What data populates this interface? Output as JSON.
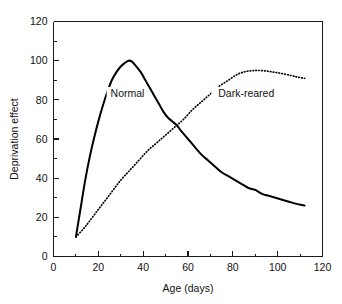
{
  "chart_data": {
    "type": "line",
    "title": "",
    "xlabel": "Age (days)",
    "ylabel": "Deprivation effect",
    "xlim": [
      0,
      120
    ],
    "ylim": [
      0,
      120
    ],
    "grid": false,
    "legend_position": "inline-annotations",
    "x_major_ticks": [
      0,
      20,
      40,
      60,
      80,
      100,
      120
    ],
    "y_major_ticks": [
      0,
      20,
      40,
      60,
      80,
      100,
      120
    ],
    "x_tick_labels": [
      "0",
      "20",
      "40",
      "60",
      "80",
      "100",
      "120"
    ],
    "y_tick_labels": [
      "0",
      "20",
      "40",
      "60",
      "80",
      "100",
      "120"
    ],
    "x_minor_ticks": [
      10,
      30,
      50,
      70,
      90,
      110
    ],
    "y_minor_ticks": [
      10,
      30,
      50,
      70,
      90,
      110
    ],
    "annotations": [
      {
        "text": "Normal",
        "x": 33,
        "y": 82
      },
      {
        "text": "Dark-reared",
        "x": 86,
        "y": 82
      }
    ],
    "series": [
      {
        "name": "Normal",
        "style": "solid",
        "color": "#000000",
        "points": [
          [
            10,
            10
          ],
          [
            12,
            24
          ],
          [
            14,
            38
          ],
          [
            16,
            50
          ],
          [
            18,
            60
          ],
          [
            20,
            69
          ],
          [
            22,
            77
          ],
          [
            24,
            84
          ],
          [
            26,
            90
          ],
          [
            28,
            94
          ],
          [
            30,
            97
          ],
          [
            32,
            99
          ],
          [
            33.5,
            100
          ],
          [
            35,
            99.5
          ],
          [
            37,
            97
          ],
          [
            39,
            94
          ],
          [
            41,
            90
          ],
          [
            43,
            86
          ],
          [
            45,
            82
          ],
          [
            47,
            78
          ],
          [
            49,
            74
          ],
          [
            51,
            71
          ],
          [
            53,
            69
          ],
          [
            55,
            67
          ],
          [
            57,
            64
          ],
          [
            60,
            60
          ],
          [
            63,
            56
          ],
          [
            66,
            52
          ],
          [
            69,
            49
          ],
          [
            72,
            46
          ],
          [
            75,
            43
          ],
          [
            78,
            41
          ],
          [
            81,
            39
          ],
          [
            84,
            37
          ],
          [
            87,
            35
          ],
          [
            90,
            34
          ],
          [
            93,
            32
          ],
          [
            96,
            31
          ],
          [
            99,
            30
          ],
          [
            102,
            29
          ],
          [
            105,
            28
          ],
          [
            108,
            27
          ],
          [
            112,
            26
          ]
        ]
      },
      {
        "name": "Dark-reared",
        "style": "dotted",
        "color": "#000000",
        "points": [
          [
            10,
            10
          ],
          [
            14,
            15
          ],
          [
            18,
            21
          ],
          [
            22,
            27
          ],
          [
            26,
            33
          ],
          [
            30,
            39
          ],
          [
            34,
            44
          ],
          [
            38,
            49
          ],
          [
            42,
            54
          ],
          [
            46,
            58
          ],
          [
            50,
            62
          ],
          [
            54,
            66
          ],
          [
            58,
            70
          ],
          [
            62,
            75
          ],
          [
            66,
            79
          ],
          [
            70,
            83
          ],
          [
            74,
            87
          ],
          [
            78,
            90
          ],
          [
            82,
            93
          ],
          [
            86,
            94.5
          ],
          [
            90,
            95
          ],
          [
            94,
            94.8
          ],
          [
            98,
            94.2
          ],
          [
            102,
            93.4
          ],
          [
            106,
            92.4
          ],
          [
            109,
            91.6
          ],
          [
            112,
            91
          ]
        ]
      }
    ]
  }
}
